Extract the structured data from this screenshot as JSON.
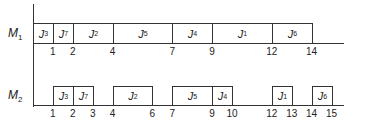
{
  "chart_data": {
    "type": "gantt",
    "title": "",
    "xlabel": "",
    "ylabel": "",
    "machines": [
      {
        "name": "M",
        "sub": "1",
        "jobs": [
          {
            "name": "J",
            "sub": "3",
            "start": 0,
            "end": 1
          },
          {
            "name": "J",
            "sub": "7",
            "start": 1,
            "end": 2
          },
          {
            "name": "J",
            "sub": "2",
            "start": 2,
            "end": 4
          },
          {
            "name": "J",
            "sub": "5",
            "start": 4,
            "end": 7
          },
          {
            "name": "J",
            "sub": "4",
            "start": 7,
            "end": 9
          },
          {
            "name": "J",
            "sub": "1",
            "start": 9,
            "end": 12
          },
          {
            "name": "J",
            "sub": "6",
            "start": 12,
            "end": 14
          }
        ],
        "ticks": [
          1,
          2,
          4,
          7,
          9,
          12,
          14
        ]
      },
      {
        "name": "M",
        "sub": "2",
        "jobs": [
          {
            "name": "J",
            "sub": "3",
            "start": 1,
            "end": 2
          },
          {
            "name": "J",
            "sub": "7",
            "start": 2,
            "end": 3
          },
          {
            "name": "J",
            "sub": "2",
            "start": 4,
            "end": 6
          },
          {
            "name": "J",
            "sub": "5",
            "start": 7,
            "end": 9
          },
          {
            "name": "J",
            "sub": "4",
            "start": 9,
            "end": 10
          },
          {
            "name": "J",
            "sub": "1",
            "start": 12,
            "end": 13
          },
          {
            "name": "J",
            "sub": "6",
            "start": 14,
            "end": 15
          }
        ],
        "ticks": [
          1,
          2,
          3,
          4,
          6,
          7,
          9,
          10,
          12,
          13,
          14,
          15
        ]
      }
    ],
    "x_range": [
      0,
      15.5
    ]
  },
  "layout": {
    "origin_x": 33,
    "px_per_unit": 19.9,
    "rows": [
      {
        "top": 23,
        "height": 21,
        "label_top": 26,
        "tick_top": 46
      },
      {
        "top": 86,
        "height": 20,
        "label_top": 88,
        "tick_top": 108
      }
    ]
  }
}
